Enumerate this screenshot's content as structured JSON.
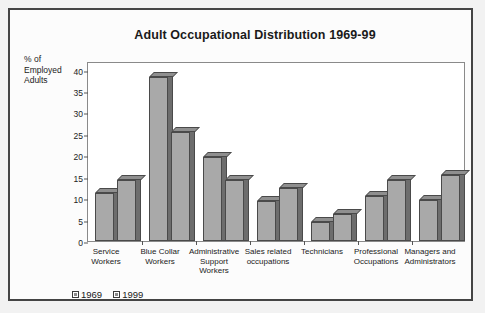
{
  "chart_data": {
    "type": "bar",
    "title": "Adult Occupational Distribution 1969-99",
    "xlabel": "",
    "ylabel": "% of Employed Adults",
    "ylim": [
      0,
      42
    ],
    "yticks": [
      0,
      5,
      10,
      15,
      20,
      25,
      30,
      35,
      40
    ],
    "grid": false,
    "legend_position": "bottom-left",
    "categories": [
      "Service Workers",
      "Blue Collar Workers",
      "Administrative Support Workers",
      "Sales related occupations",
      "Technicians",
      "Professional Occupations",
      "Managers and Administrators"
    ],
    "category_lines": [
      [
        "Service",
        "Workers"
      ],
      [
        "Blue Collar",
        "Workers"
      ],
      [
        "Administrative",
        "Support",
        "Workers"
      ],
      [
        "Sales related",
        "occupations"
      ],
      [
        "Technicians"
      ],
      [
        "Professional",
        "Occupations"
      ],
      [
        "Managers and",
        "Administrators"
      ]
    ],
    "series": [
      {
        "name": "1969",
        "values": [
          11.3,
          38.3,
          19.5,
          9.3,
          4.5,
          10.4,
          9.5
        ]
      },
      {
        "name": "1999",
        "values": [
          14.3,
          25.4,
          14.3,
          12.3,
          6.2,
          14.3,
          15.3
        ]
      }
    ],
    "colors": {
      "bar_front": "#a9a9a9",
      "bar_side": "#6d6d6d",
      "bar_top": "#8f8f8f",
      "bar_outline": "#4a4a4a",
      "frame": "#444444",
      "plot_border": "#8a8a8a",
      "page_background": "#f2f2f2",
      "plot_background": "#ffffff",
      "text": "#1a1a1a"
    }
  },
  "legend": {
    "items": [
      {
        "label": "1969"
      },
      {
        "label": "1999"
      }
    ]
  }
}
